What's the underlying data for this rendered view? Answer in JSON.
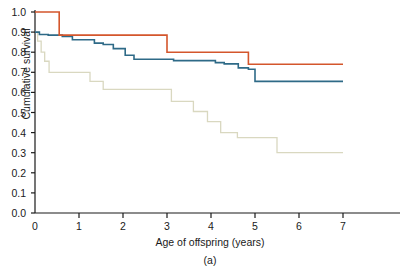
{
  "chart_data": {
    "type": "line",
    "subtype": "kaplan-meier-step",
    "title": "",
    "panel_label": "(a)",
    "xlabel": "Age of offspring (years)",
    "ylabel": "Cumulative survival",
    "xlim": [
      0,
      7.9
    ],
    "ylim": [
      0,
      1.0
    ],
    "xticks": [
      0,
      1,
      2,
      3,
      4,
      5,
      6,
      7
    ],
    "xtick_labels": [
      "0",
      "1",
      "2",
      "3",
      "4",
      "5",
      "6",
      "7"
    ],
    "yticks": [
      0.0,
      0.1,
      0.2,
      0.3,
      0.4,
      0.5,
      0.6,
      0.7,
      0.8,
      0.9,
      1.0
    ],
    "ytick_labels": [
      "0.0",
      "0.1",
      "0.2",
      "0.3",
      "0.4",
      "0.5",
      "0.6",
      "0.7",
      "0.8",
      "0.9",
      "1.0"
    ],
    "grid": false,
    "legend": "none",
    "axis_color": "#1a1a1a",
    "series": [
      {
        "name": "red-curve",
        "color": "#d4562c",
        "x": [
          0,
          0.55,
          0.55,
          3.0,
          3.0,
          4.85,
          4.85,
          7.0
        ],
        "y": [
          1.0,
          1.0,
          0.885,
          0.885,
          0.8,
          0.8,
          0.74,
          0.74
        ]
      },
      {
        "name": "blue-curve",
        "color": "#2e6a87",
        "x": [
          0,
          0.1,
          0.1,
          0.3,
          0.3,
          0.62,
          0.62,
          0.85,
          0.85,
          1.35,
          1.35,
          1.55,
          1.55,
          1.78,
          1.78,
          2.05,
          2.05,
          2.25,
          2.25,
          3.15,
          3.15,
          4.1,
          4.1,
          4.3,
          4.3,
          4.62,
          4.62,
          4.85,
          4.85,
          5.0,
          5.0,
          7.0
        ],
        "y": [
          0.9,
          0.9,
          0.888,
          0.888,
          0.885,
          0.885,
          0.878,
          0.878,
          0.862,
          0.862,
          0.845,
          0.845,
          0.838,
          0.838,
          0.818,
          0.818,
          0.785,
          0.785,
          0.765,
          0.765,
          0.758,
          0.758,
          0.748,
          0.748,
          0.742,
          0.742,
          0.722,
          0.722,
          0.715,
          0.715,
          0.655,
          0.655
        ]
      },
      {
        "name": "tan-curve",
        "color": "#d9d8c0",
        "x": [
          0,
          0.06,
          0.06,
          0.14,
          0.14,
          0.22,
          0.22,
          0.32,
          0.32,
          1.25,
          1.25,
          1.55,
          1.55,
          3.1,
          3.1,
          3.6,
          3.6,
          3.92,
          3.92,
          4.22,
          4.22,
          4.6,
          4.6,
          5.5,
          5.5,
          7.0
        ],
        "y": [
          0.9,
          0.9,
          0.855,
          0.855,
          0.8,
          0.8,
          0.755,
          0.755,
          0.7,
          0.7,
          0.655,
          0.655,
          0.615,
          0.615,
          0.555,
          0.555,
          0.505,
          0.505,
          0.455,
          0.455,
          0.4,
          0.4,
          0.375,
          0.375,
          0.3,
          0.3
        ]
      }
    ]
  },
  "axes": {
    "ylabel": "Cumulative survival",
    "xlabel": "Age of offspring (years)",
    "panel_label": "(a)"
  }
}
